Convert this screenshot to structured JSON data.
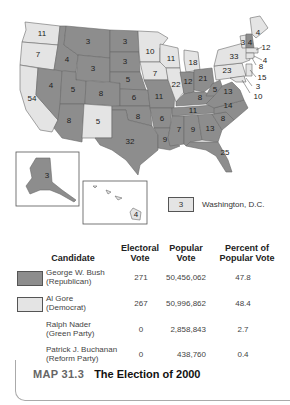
{
  "map": {
    "colors": {
      "republican": "#8d8d8d",
      "democrat": "#e4e4e4"
    },
    "states": [
      {
        "name": "WA",
        "ev": "11",
        "party": "democrat"
      },
      {
        "name": "OR",
        "ev": "7",
        "party": "democrat"
      },
      {
        "name": "CA",
        "ev": "54",
        "party": "democrat"
      },
      {
        "name": "ID",
        "ev": "4",
        "party": "republican"
      },
      {
        "name": "NV",
        "ev": "4",
        "party": "republican"
      },
      {
        "name": "MT",
        "ev": "3",
        "party": "republican"
      },
      {
        "name": "WY",
        "ev": "3",
        "party": "republican"
      },
      {
        "name": "UT",
        "ev": "5",
        "party": "republican"
      },
      {
        "name": "AZ",
        "ev": "8",
        "party": "republican"
      },
      {
        "name": "CO",
        "ev": "8",
        "party": "republican"
      },
      {
        "name": "NM",
        "ev": "5",
        "party": "democrat"
      },
      {
        "name": "ND",
        "ev": "3",
        "party": "republican"
      },
      {
        "name": "SD",
        "ev": "3",
        "party": "republican"
      },
      {
        "name": "NE",
        "ev": "5",
        "party": "republican"
      },
      {
        "name": "KS",
        "ev": "6",
        "party": "republican"
      },
      {
        "name": "OK",
        "ev": "8",
        "party": "republican"
      },
      {
        "name": "TX",
        "ev": "32",
        "party": "republican"
      },
      {
        "name": "MN",
        "ev": "10",
        "party": "democrat"
      },
      {
        "name": "IA",
        "ev": "7",
        "party": "democrat"
      },
      {
        "name": "MO",
        "ev": "11",
        "party": "republican"
      },
      {
        "name": "AR",
        "ev": "6",
        "party": "republican"
      },
      {
        "name": "LA",
        "ev": "9",
        "party": "republican"
      },
      {
        "name": "WI",
        "ev": "11",
        "party": "democrat"
      },
      {
        "name": "IL",
        "ev": "22",
        "party": "democrat"
      },
      {
        "name": "MI",
        "ev": "18",
        "party": "democrat"
      },
      {
        "name": "IN",
        "ev": "12",
        "party": "republican"
      },
      {
        "name": "OH",
        "ev": "21",
        "party": "republican"
      },
      {
        "name": "KY",
        "ev": "8",
        "party": "republican"
      },
      {
        "name": "TN",
        "ev": "11",
        "party": "republican"
      },
      {
        "name": "MS",
        "ev": "7",
        "party": "republican"
      },
      {
        "name": "AL",
        "ev": "9",
        "party": "republican"
      },
      {
        "name": "GA",
        "ev": "13",
        "party": "republican"
      },
      {
        "name": "FL",
        "ev": "25",
        "party": "republican"
      },
      {
        "name": "SC",
        "ev": "8",
        "party": "republican"
      },
      {
        "name": "NC",
        "ev": "14",
        "party": "republican"
      },
      {
        "name": "VA",
        "ev": "13",
        "party": "republican"
      },
      {
        "name": "WV",
        "ev": "5",
        "party": "republican"
      },
      {
        "name": "PA",
        "ev": "23",
        "party": "democrat"
      },
      {
        "name": "NY",
        "ev": "33",
        "party": "democrat"
      },
      {
        "name": "VT",
        "ev": "3",
        "party": "democrat"
      },
      {
        "name": "NH",
        "ev": "4",
        "party": "republican"
      },
      {
        "name": "ME",
        "ev": "4",
        "party": "democrat"
      },
      {
        "name": "MA",
        "ev": "12",
        "party": "democrat"
      },
      {
        "name": "RI",
        "ev": "4",
        "party": "democrat"
      },
      {
        "name": "CT",
        "ev": "8",
        "party": "democrat"
      },
      {
        "name": "NJ",
        "ev": "15",
        "party": "democrat"
      },
      {
        "name": "DE",
        "ev": "3",
        "party": "democrat"
      },
      {
        "name": "MD",
        "ev": "10",
        "party": "democrat"
      },
      {
        "name": "AK",
        "ev": "3",
        "party": "republican"
      },
      {
        "name": "HI",
        "ev": "4",
        "party": "democrat"
      }
    ],
    "dc": {
      "ev": "3",
      "label": "Washington, D.C."
    }
  },
  "table": {
    "headers": {
      "candidate": "Candidate",
      "electoral_1": "Electoral",
      "electoral_2": "Vote",
      "popular_1": "Popular",
      "popular_2": "Vote",
      "percent_1": "Percent of",
      "percent_2": "Popular Vote"
    },
    "rows": [
      {
        "name": "George W. Bush",
        "party": "(Republican)",
        "electoral": "271",
        "popular": "50,456,062",
        "percent": "47.8"
      },
      {
        "name": "Al Gore",
        "party": "(Democrat)",
        "electoral": "267",
        "popular": "50,996,862",
        "percent": "48.4"
      },
      {
        "name": "Ralph Nader",
        "party": "(Green Party)",
        "electoral": "0",
        "popular": "2,858,843",
        "percent": "2.7"
      },
      {
        "name": "Patrick J. Buchanan",
        "party": "(Reform Party)",
        "electoral": "0",
        "popular": "438,760",
        "percent": "0.4"
      }
    ]
  },
  "caption": {
    "number": "MAP 31.3",
    "title": "The Election of 2000"
  }
}
